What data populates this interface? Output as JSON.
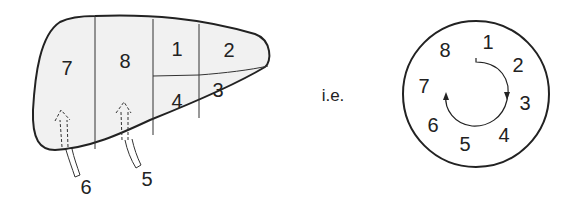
{
  "colors": {
    "outline": "#222222",
    "liver_fill": "#f1f1f1",
    "background": "#ffffff"
  },
  "liver_diagram": {
    "segments": [
      {
        "label": "7",
        "x": 67,
        "y": 70
      },
      {
        "label": "8",
        "x": 125,
        "y": 63
      },
      {
        "label": "1",
        "x": 177,
        "y": 51
      },
      {
        "label": "2",
        "x": 229,
        "y": 52
      },
      {
        "label": "4",
        "x": 177,
        "y": 103
      },
      {
        "label": "3",
        "x": 218,
        "y": 92
      }
    ],
    "arrows": [
      {
        "label": "6",
        "label_x": 86,
        "label_y": 189
      },
      {
        "label": "5",
        "label_x": 147,
        "label_y": 181
      }
    ]
  },
  "connector_text": "i.e.",
  "clock_diagram": {
    "labels": [
      {
        "label": "1",
        "x": 488,
        "y": 44
      },
      {
        "label": "2",
        "x": 518,
        "y": 67
      },
      {
        "label": "3",
        "x": 525,
        "y": 105
      },
      {
        "label": "4",
        "x": 504,
        "y": 137
      },
      {
        "label": "5",
        "x": 465,
        "y": 146
      },
      {
        "label": "6",
        "x": 433,
        "y": 127
      },
      {
        "label": "7",
        "x": 424,
        "y": 88
      },
      {
        "label": "8",
        "x": 445,
        "y": 52
      }
    ],
    "direction": "clockwise"
  }
}
